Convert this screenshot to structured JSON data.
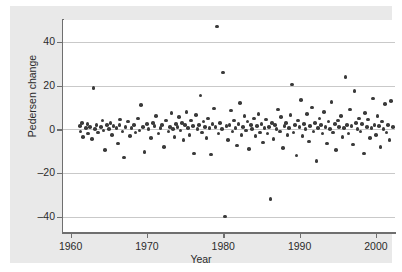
{
  "chart_data": {
    "type": "scatter",
    "title": "",
    "xlabel": "Year",
    "ylabel": "Pedersen change",
    "xlim": [
      1959.0,
      2002.5
    ],
    "ylim": [
      -47,
      50
    ],
    "xticks": [
      1960,
      1970,
      1980,
      1990,
      2000
    ],
    "xtick_labels": [
      "1960",
      "1970",
      "1980",
      "1990",
      "2000"
    ],
    "yticks": [
      40,
      20,
      0,
      -20,
      -40
    ],
    "ytick_labels": [
      "40",
      "20",
      "0",
      "–20",
      "–40"
    ],
    "grid": "horizontal",
    "legend": null,
    "marker": {
      "shape": "circle",
      "color": "#3a3a3a",
      "size": 3.6
    },
    "panel_background": "#e9e9e9",
    "plot_background": "#ffffff",
    "gridline_color": "#c9c9c9",
    "axis_color": "#6f6f6f",
    "points": [
      [
        1961.2,
        1.5
      ],
      [
        1961.3,
        -1.0
      ],
      [
        1961.5,
        3.0
      ],
      [
        1961.6,
        -3.5
      ],
      [
        1962.0,
        0.5
      ],
      [
        1962.2,
        2.5
      ],
      [
        1962.3,
        -2.0
      ],
      [
        1962.5,
        1.0
      ],
      [
        1962.8,
        -4.5
      ],
      [
        1963.0,
        19.0
      ],
      [
        1963.2,
        0.0
      ],
      [
        1963.4,
        2.0
      ],
      [
        1963.6,
        -1.5
      ],
      [
        1964.0,
        1.0
      ],
      [
        1964.2,
        4.0
      ],
      [
        1964.3,
        -0.5
      ],
      [
        1964.5,
        -9.5
      ],
      [
        1964.8,
        2.0
      ],
      [
        1965.0,
        0.0
      ],
      [
        1965.2,
        3.0
      ],
      [
        1965.4,
        -2.5
      ],
      [
        1965.6,
        1.5
      ],
      [
        1966.0,
        0.5
      ],
      [
        1966.2,
        -6.5
      ],
      [
        1966.4,
        2.0
      ],
      [
        1966.5,
        4.5
      ],
      [
        1966.8,
        -1.0
      ],
      [
        1967.0,
        -13.0
      ],
      [
        1967.2,
        1.0
      ],
      [
        1967.5,
        3.5
      ],
      [
        1967.8,
        -3.0
      ],
      [
        1968.0,
        0.5
      ],
      [
        1968.3,
        2.0
      ],
      [
        1968.5,
        -1.5
      ],
      [
        1968.8,
        5.0
      ],
      [
        1969.0,
        -0.5
      ],
      [
        1969.2,
        11.0
      ],
      [
        1969.5,
        1.0
      ],
      [
        1969.7,
        -10.5
      ],
      [
        1970.0,
        2.5
      ],
      [
        1970.2,
        0.0
      ],
      [
        1970.5,
        -4.0
      ],
      [
        1970.8,
        3.0
      ],
      [
        1971.0,
        1.5
      ],
      [
        1971.2,
        6.0
      ],
      [
        1971.5,
        -2.0
      ],
      [
        1971.8,
        0.5
      ],
      [
        1972.0,
        2.0
      ],
      [
        1972.2,
        -8.0
      ],
      [
        1972.5,
        4.0
      ],
      [
        1972.8,
        -1.0
      ],
      [
        1973.0,
        1.0
      ],
      [
        1973.2,
        7.5
      ],
      [
        1973.4,
        0.0
      ],
      [
        1973.6,
        -3.5
      ],
      [
        1973.8,
        2.5
      ],
      [
        1974.0,
        1.0
      ],
      [
        1974.2,
        5.5
      ],
      [
        1974.4,
        -0.5
      ],
      [
        1974.6,
        3.0
      ],
      [
        1974.8,
        -5.0
      ],
      [
        1975.0,
        2.0
      ],
      [
        1975.2,
        8.0
      ],
      [
        1975.4,
        0.5
      ],
      [
        1975.6,
        -2.5
      ],
      [
        1975.8,
        4.0
      ],
      [
        1976.0,
        1.5
      ],
      [
        1976.2,
        -11.0
      ],
      [
        1976.4,
        6.5
      ],
      [
        1976.6,
        0.0
      ],
      [
        1976.8,
        2.0
      ],
      [
        1977.0,
        15.5
      ],
      [
        1977.2,
        -1.5
      ],
      [
        1977.4,
        3.5
      ],
      [
        1977.6,
        1.0
      ],
      [
        1977.8,
        -4.0
      ],
      [
        1978.0,
        5.0
      ],
      [
        1978.2,
        0.5
      ],
      [
        1978.4,
        -11.5
      ],
      [
        1978.6,
        2.5
      ],
      [
        1978.8,
        9.5
      ],
      [
        1979.0,
        1.0
      ],
      [
        1979.2,
        47.0
      ],
      [
        1979.4,
        -2.0
      ],
      [
        1979.6,
        3.0
      ],
      [
        1979.8,
        0.0
      ],
      [
        1980.0,
        26.0
      ],
      [
        1980.2,
        -40.0
      ],
      [
        1980.4,
        1.5
      ],
      [
        1980.6,
        -5.0
      ],
      [
        1980.8,
        2.0
      ],
      [
        1981.0,
        8.5
      ],
      [
        1981.2,
        -1.0
      ],
      [
        1981.4,
        4.0
      ],
      [
        1981.6,
        0.5
      ],
      [
        1981.8,
        -7.5
      ],
      [
        1982.0,
        2.5
      ],
      [
        1982.2,
        12.0
      ],
      [
        1982.4,
        -2.5
      ],
      [
        1982.6,
        1.0
      ],
      [
        1982.8,
        6.0
      ],
      [
        1983.0,
        -0.5
      ],
      [
        1983.2,
        3.5
      ],
      [
        1983.4,
        -9.0
      ],
      [
        1983.6,
        2.0
      ],
      [
        1983.8,
        0.0
      ],
      [
        1984.0,
        5.0
      ],
      [
        1984.2,
        -3.0
      ],
      [
        1984.4,
        1.5
      ],
      [
        1984.6,
        7.0
      ],
      [
        1984.8,
        -1.5
      ],
      [
        1985.0,
        2.5
      ],
      [
        1985.2,
        -6.0
      ],
      [
        1985.4,
        0.5
      ],
      [
        1985.6,
        4.5
      ],
      [
        1985.8,
        -2.0
      ],
      [
        1986.0,
        1.0
      ],
      [
        1986.2,
        -32.0
      ],
      [
        1986.4,
        3.0
      ],
      [
        1986.6,
        -4.5
      ],
      [
        1986.8,
        2.0
      ],
      [
        1987.0,
        0.0
      ],
      [
        1987.2,
        9.0
      ],
      [
        1987.4,
        -1.0
      ],
      [
        1987.6,
        5.5
      ],
      [
        1987.8,
        -8.5
      ],
      [
        1988.0,
        1.5
      ],
      [
        1988.2,
        3.0
      ],
      [
        1988.4,
        -2.5
      ],
      [
        1988.6,
        0.5
      ],
      [
        1988.8,
        6.5
      ],
      [
        1989.0,
        20.5
      ],
      [
        1989.2,
        -1.5
      ],
      [
        1989.4,
        2.0
      ],
      [
        1989.6,
        -12.0
      ],
      [
        1989.8,
        4.0
      ],
      [
        1990.0,
        1.0
      ],
      [
        1990.2,
        13.5
      ],
      [
        1990.4,
        -3.0
      ],
      [
        1990.6,
        2.5
      ],
      [
        1990.8,
        0.0
      ],
      [
        1991.0,
        7.0
      ],
      [
        1991.2,
        -5.5
      ],
      [
        1991.4,
        1.5
      ],
      [
        1991.6,
        10.0
      ],
      [
        1991.8,
        -1.0
      ],
      [
        1992.0,
        3.0
      ],
      [
        1992.2,
        -14.5
      ],
      [
        1992.4,
        0.5
      ],
      [
        1992.6,
        5.0
      ],
      [
        1992.8,
        2.0
      ],
      [
        1993.0,
        -2.0
      ],
      [
        1993.2,
        8.0
      ],
      [
        1993.4,
        1.0
      ],
      [
        1993.6,
        -6.5
      ],
      [
        1993.8,
        3.5
      ],
      [
        1994.0,
        0.0
      ],
      [
        1994.2,
        12.5
      ],
      [
        1994.4,
        -1.5
      ],
      [
        1994.6,
        2.5
      ],
      [
        1994.8,
        -9.5
      ],
      [
        1995.0,
        4.0
      ],
      [
        1995.2,
        1.0
      ],
      [
        1995.4,
        6.0
      ],
      [
        1995.6,
        -3.5
      ],
      [
        1995.8,
        0.5
      ],
      [
        1996.0,
        24.0
      ],
      [
        1996.2,
        2.0
      ],
      [
        1996.4,
        -2.0
      ],
      [
        1996.6,
        9.0
      ],
      [
        1996.8,
        1.5
      ],
      [
        1997.0,
        -7.0
      ],
      [
        1997.2,
        17.5
      ],
      [
        1997.4,
        3.0
      ],
      [
        1997.6,
        0.0
      ],
      [
        1997.8,
        5.0
      ],
      [
        1998.0,
        -1.0
      ],
      [
        1998.2,
        2.5
      ],
      [
        1998.4,
        -11.0
      ],
      [
        1998.6,
        7.5
      ],
      [
        1998.8,
        1.0
      ],
      [
        1999.0,
        4.5
      ],
      [
        1999.2,
        -4.0
      ],
      [
        1999.4,
        0.5
      ],
      [
        1999.6,
        14.0
      ],
      [
        1999.8,
        2.0
      ],
      [
        2000.0,
        -2.5
      ],
      [
        2000.2,
        6.0
      ],
      [
        2000.4,
        1.5
      ],
      [
        2000.6,
        -8.0
      ],
      [
        2000.8,
        3.5
      ],
      [
        2001.0,
        0.0
      ],
      [
        2001.2,
        11.5
      ],
      [
        2001.4,
        -1.5
      ],
      [
        2001.6,
        2.0
      ],
      [
        2001.8,
        -5.0
      ],
      [
        2002.0,
        13.0
      ],
      [
        2002.2,
        1.0
      ]
    ]
  }
}
